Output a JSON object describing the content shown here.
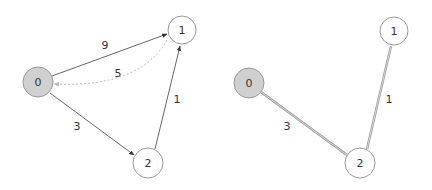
{
  "diagrams": [
    {
      "name": "graph",
      "nodes": [
        {
          "id": "0",
          "label": "0",
          "x": 38,
          "y": 82,
          "r": 15,
          "fill": "#d0d0d0"
        },
        {
          "id": "1",
          "label": "1",
          "x": 182,
          "y": 30,
          "r": 14,
          "fill": "#ffffff"
        },
        {
          "id": "2",
          "label": "2",
          "x": 148,
          "y": 163,
          "r": 15,
          "fill": "#ffffff"
        }
      ],
      "edges": [
        {
          "from": "0",
          "to": "1",
          "weight": "9",
          "style": "solid",
          "label_x": 105,
          "label_y": 49
        },
        {
          "from": "1",
          "to": "0",
          "weight": "5",
          "style": "dotted",
          "label_x": 118,
          "label_y": 77
        },
        {
          "from": "0",
          "to": "2",
          "weight": "3",
          "style": "solid",
          "label_x": 77,
          "label_y": 130
        },
        {
          "from": "2",
          "to": "1",
          "weight": "1",
          "style": "solid",
          "label_x": 177,
          "label_y": 103
        }
      ]
    },
    {
      "name": "shortest-path-tree",
      "nodes": [
        {
          "id": "0",
          "label": "0",
          "x": 249,
          "y": 83,
          "r": 15,
          "fill": "#d0d0d0"
        },
        {
          "id": "1",
          "label": "1",
          "x": 394,
          "y": 31,
          "r": 14,
          "fill": "#ffffff"
        },
        {
          "id": "2",
          "label": "2",
          "x": 360,
          "y": 163,
          "r": 15,
          "fill": "#ffffff"
        }
      ],
      "edges": [
        {
          "from": "0",
          "to": "2",
          "weight": "3",
          "style": "double",
          "label_x": 287,
          "label_y": 130
        },
        {
          "from": "2",
          "to": "1",
          "weight": "1",
          "style": "double",
          "label_x": 389,
          "label_y": 103
        }
      ]
    }
  ],
  "colors": {
    "edge": "#555555",
    "edge_dotted": "#b8b8b8",
    "edge_double": "#9a9a9a",
    "node_stroke": "#999999",
    "source_fill": "#d0d0d0"
  }
}
